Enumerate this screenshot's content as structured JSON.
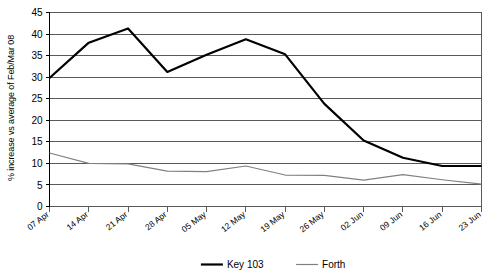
{
  "chart_data": {
    "type": "line",
    "title": "",
    "xlabel": "",
    "ylabel": "% increase vs average of Feb/Mar 08",
    "categories": [
      "07 Apr",
      "14 Apr",
      "21 Apr",
      "28 Apr",
      "05 May",
      "12 May",
      "19 May",
      "26 May",
      "02 Jun",
      "09 Jun",
      "16 Jun",
      "23 Jun"
    ],
    "series": [
      {
        "name": "Key 103",
        "color": "#000000",
        "values": [
          29.8,
          38.0,
          41.3,
          31.2,
          35.2,
          38.8,
          35.3,
          23.8,
          15.3,
          11.3,
          9.4,
          9.4
        ]
      },
      {
        "name": "Forth",
        "color": "#808080",
        "values": [
          12.4,
          10.0,
          9.9,
          8.2,
          8.1,
          9.4,
          7.3,
          7.2,
          6.1,
          7.4,
          6.2,
          5.2
        ]
      }
    ],
    "ylim": [
      0,
      45
    ],
    "yticks": [
      0,
      5,
      10,
      15,
      20,
      25,
      30,
      35,
      40,
      45
    ],
    "ytick_labels": [
      "0",
      "5",
      "10",
      "15",
      "20",
      "25",
      "30",
      "35",
      "40",
      "45"
    ],
    "grid": true,
    "grid_axis": "y",
    "legend_position": "bottom",
    "legend": [
      {
        "label": "Key 103",
        "color": "#000000",
        "line_width": 2.2
      },
      {
        "label": "Forth",
        "color": "#808080",
        "line_width": 1.2
      }
    ],
    "note": "Key 103 series has 13 plotted vertices; last segment ends near 7.3 at the right plot edge."
  },
  "axis": {
    "y_title": "% increase vs average of Feb/Mar 08"
  }
}
